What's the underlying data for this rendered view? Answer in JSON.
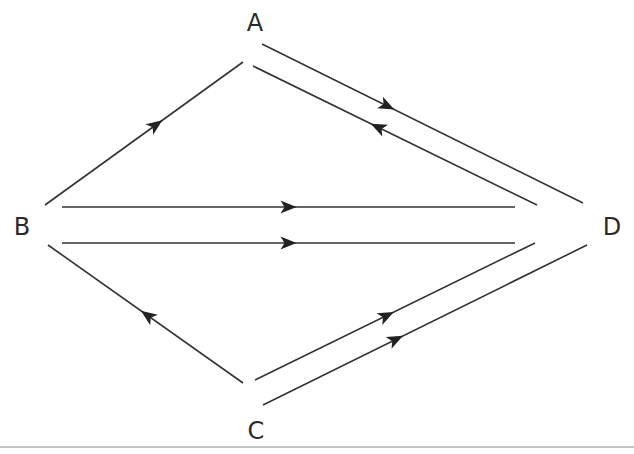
{
  "diagram": {
    "type": "directed-graph",
    "nodes": [
      {
        "id": "A",
        "label": "A"
      },
      {
        "id": "B",
        "label": "B"
      },
      {
        "id": "C",
        "label": "C"
      },
      {
        "id": "D",
        "label": "D"
      }
    ],
    "edges": [
      {
        "from": "B",
        "to": "A"
      },
      {
        "from": "A",
        "to": "D"
      },
      {
        "from": "D",
        "to": "A"
      },
      {
        "from": "B",
        "to": "D"
      },
      {
        "from": "B",
        "to": "D"
      },
      {
        "from": "C",
        "to": "B"
      },
      {
        "from": "C",
        "to": "D"
      },
      {
        "from": "C",
        "to": "D"
      }
    ],
    "colors": {
      "line": "#333333",
      "arrow": "#222222",
      "text": "#2a2a2a"
    }
  }
}
